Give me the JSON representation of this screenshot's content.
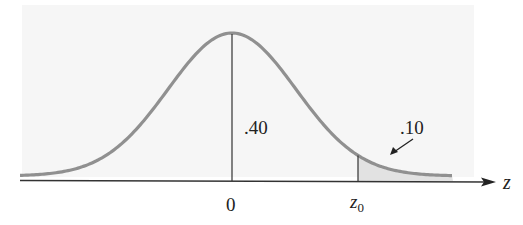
{
  "diagram": {
    "type": "normal-distribution",
    "labels": {
      "center_height": ".40",
      "tail_area": ".10",
      "x_zero": "0",
      "x_z0_main": "z",
      "x_z0_sub": "0",
      "axis": "z"
    },
    "colors": {
      "curve": "#8f8f8f",
      "shade": "#e4e4e4",
      "panel": "#f5f5f5",
      "ink": "#222222"
    }
  },
  "chart_data": {
    "type": "area",
    "title": "",
    "xlabel": "z",
    "ylabel": "",
    "curve": "standard normal density",
    "ticks": [
      "0",
      "z0"
    ],
    "annotations": [
      {
        "text": ".40",
        "meaning": "area between 0 and z0"
      },
      {
        "text": ".10",
        "meaning": "shaded right-tail area beyond z0"
      }
    ],
    "shaded_region": {
      "from": "z0",
      "to": "+inf",
      "area": 0.1
    }
  }
}
